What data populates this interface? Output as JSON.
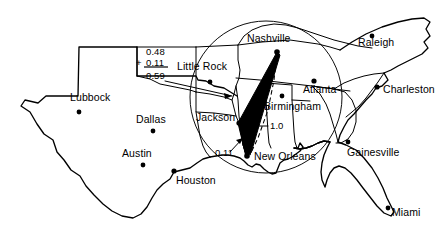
{
  "figure": {
    "type": "map",
    "region": "Southeastern United States",
    "background_color": "#ffffff",
    "ink_color": "#000000"
  },
  "cities": [
    {
      "name": "Lubbock",
      "label_x": 70,
      "label_y": 92,
      "dot_x": 79,
      "dot_y": 112
    },
    {
      "name": "Dallas",
      "label_x": 136,
      "label_y": 114,
      "dot_x": 153,
      "dot_y": 131
    },
    {
      "name": "Austin",
      "label_x": 122,
      "label_y": 148,
      "dot_x": 143,
      "dot_y": 165
    },
    {
      "name": "Houston",
      "label_x": 176,
      "label_y": 175,
      "dot_x": 174,
      "dot_y": 171
    },
    {
      "name": "Little Rock",
      "label_x": 177,
      "label_y": 66,
      "dot_x": 210,
      "dot_y": 82
    },
    {
      "name": "Jackson",
      "label_x": 196,
      "label_y": 112,
      "dot_x": 239,
      "dot_y": 123
    },
    {
      "name": "Nashville",
      "label_x": 247,
      "label_y": 36,
      "dot_x": 277,
      "dot_y": 52
    },
    {
      "name": "Birmingham",
      "label_x": 264,
      "label_y": 102,
      "dot_x": 282,
      "dot_y": 96
    },
    {
      "name": "New Orleans",
      "label_x": 254,
      "label_y": 152,
      "dot_x": 247,
      "dot_y": 156
    },
    {
      "name": "Atlanta",
      "label_x": 306,
      "label_y": 86,
      "dot_x": 314,
      "dot_y": 81
    },
    {
      "name": "Raleigh",
      "label_x": 358,
      "label_y": 40,
      "dot_x": 372,
      "dot_y": 36
    },
    {
      "name": "Charleston",
      "label_x": 381,
      "label_y": 86,
      "dot_x": 377,
      "dot_y": 87
    },
    {
      "name": "Gainesville",
      "label_x": 348,
      "label_y": 150,
      "dot_x": 348,
      "dot_y": 142
    },
    {
      "name": "Miami",
      "label_x": 394,
      "label_y": 213,
      "dot_x": 388,
      "dot_y": 208
    }
  ],
  "annotations": {
    "sum_block": {
      "addend_1": "0.48",
      "plus_sign": "+",
      "addend_2": "0.11",
      "total": "0.59"
    },
    "dashed_route_value": "1.0",
    "local_leg_value": "0.11"
  },
  "overlays": {
    "range_circle_label": "coverage-circle",
    "solid_route_label": "nashville-new-orleans-route",
    "dashed_route_label": "alternate-route"
  }
}
